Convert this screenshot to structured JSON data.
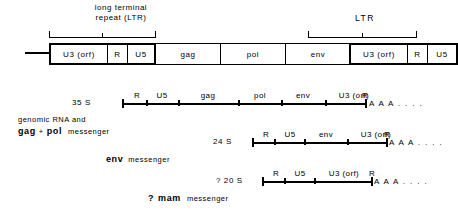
{
  "diagram": {
    "title_brackets": {
      "left_caption_line1": "long terminal",
      "left_caption_line2": "repeat (LTR)",
      "right_caption": "LTR"
    },
    "provirus": {
      "segments": [
        {
          "label": "U3  (orf)",
          "group": "ltr"
        },
        {
          "label": "R",
          "group": "ltr"
        },
        {
          "label": "U5",
          "group": "ltr"
        },
        {
          "label": "gag",
          "group": "gene"
        },
        {
          "label": "pol",
          "group": "gene"
        },
        {
          "label": "env",
          "group": "gene"
        },
        {
          "label": "U3  (orf)",
          "group": "ltr"
        },
        {
          "label": "R",
          "group": "ltr"
        },
        {
          "label": "U5",
          "group": "ltr"
        }
      ]
    },
    "transcripts": [
      {
        "s_value": "35 S",
        "segments": [
          "R",
          "U5",
          "gag",
          "pol",
          "env",
          "U3  (orf)",
          "R"
        ],
        "tail": "A A A . . . .",
        "description_line1": "genomic RNA and",
        "description_bold": "gag",
        "description_plus": "+",
        "description_bold2": "pol",
        "description_rest": "messenger"
      },
      {
        "s_value": "24 S",
        "segments": [
          "R",
          "U5",
          "env",
          "U3  (orf)",
          "R"
        ],
        "tail": "A A A . . . .",
        "description_bold": "env",
        "description_rest": "messenger"
      },
      {
        "s_value": "? 20 S",
        "segments": [
          "R",
          "U5",
          "U3  (orf)",
          "R"
        ],
        "tail": "A A A . . . .",
        "description_prefix": "?",
        "description_bold": "mam",
        "description_rest": "messenger"
      }
    ],
    "colors": {
      "ink": "#000000",
      "background": "#ffffff"
    }
  }
}
